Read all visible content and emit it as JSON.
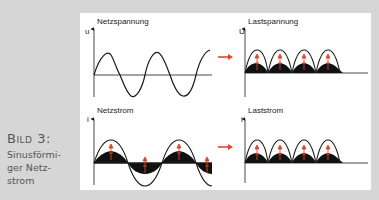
{
  "caption": {
    "figure_label": "Bild 3:",
    "lines": [
      "Sinusförmi-",
      "ger Netz-",
      "strom"
    ]
  },
  "panels": {
    "top_left": {
      "title": "Netzspannung",
      "axis_label": "u"
    },
    "top_right": {
      "title": "Lastspannung",
      "axis_label": "U"
    },
    "bottom_left": {
      "title": "Netzstrom",
      "axis_label": "i"
    },
    "bottom_right": {
      "title": "Laststrom",
      "axis_label": "i"
    }
  },
  "colors": {
    "background": "#d6d6d6",
    "panel": "#ffffff",
    "curve": "#1a1a1a",
    "arrow": "#e0452b",
    "caption_text": "#555555"
  },
  "icons": {
    "transform_arrow": "right-arrow",
    "direction_marker": "up-arrow"
  }
}
